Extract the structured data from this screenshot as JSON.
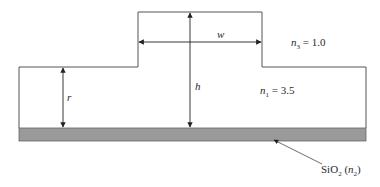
{
  "diagram": {
    "labels": {
      "width": "w",
      "height": "h",
      "slab_height": "r",
      "cladding_index_symbol": "n",
      "cladding_index_sub": "3",
      "cladding_index_value": " = 1.0",
      "core_index_symbol": "n",
      "core_index_sub": "1",
      "core_index_value": " = 3.5",
      "substrate_name": "SiO",
      "substrate_sub": "2",
      "substrate_paren_open": " (",
      "substrate_index_symbol": "n",
      "substrate_index_sub": "2",
      "substrate_paren_close": ")"
    },
    "colors": {
      "outline": "#555555",
      "arrow": "#222222",
      "substrate_fill": "#9a9a9a",
      "background": "#ffffff"
    }
  }
}
